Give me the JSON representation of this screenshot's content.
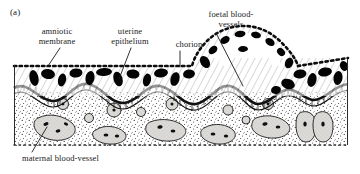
{
  "figure": {
    "panel_letter": "(a)",
    "type": "scientific-illustration",
    "background_color": "#ffffff",
    "ink_color": "#1a1a1a",
    "tissue_fill_color": "#d8d6d2",
    "vessel_fill_color": "#000000"
  },
  "labels": {
    "amniotic_membrane": "amniotic\nmembrane",
    "amniotic_membrane_line1": "amniotic",
    "amniotic_membrane_line2": "membrane",
    "uterine_epithelium_line1": "uterine",
    "uterine_epithelium_line2": "epithelium",
    "chorion": "chorion",
    "foetal_blood_vessels_line1": "foetal blood-",
    "foetal_blood_vessels_line2": "vessels",
    "maternal_blood_vessel": "maternal blood-vessel"
  },
  "leader_lines": [
    {
      "name": "amniotic-membrane-leader",
      "from": [
        60,
        48
      ],
      "to": [
        48,
        66
      ]
    },
    {
      "name": "uterine-epithelium-leader",
      "from": [
        131,
        48
      ],
      "to": [
        119,
        78
      ]
    },
    {
      "name": "chorion-leader",
      "from": [
        180,
        51
      ],
      "to": [
        180,
        67
      ]
    },
    {
      "name": "foetal-blood-vessels-leader",
      "from": [
        216,
        33
      ],
      "to": [
        243,
        85
      ]
    },
    {
      "name": "maternal-blood-vessel-leader",
      "from": [
        32,
        152
      ],
      "to": [
        47,
        128
      ]
    }
  ],
  "structures": [
    {
      "name": "amniotic-membrane",
      "style": "dotted boundary line",
      "position": "top edge of specimen and over dome"
    },
    {
      "name": "chorion-layer",
      "style": "hatched band with black blood-vessel blobs",
      "position": "upper band"
    },
    {
      "name": "uterine-epithelium",
      "style": "wavy dark ladder-hatched band",
      "position": "middle"
    },
    {
      "name": "maternal-tissue",
      "style": "stippled field with grey blood vessels",
      "position": "lower half"
    },
    {
      "name": "chorionic-villus-dome",
      "style": "large arch / dome",
      "position": "right of centre"
    }
  ]
}
